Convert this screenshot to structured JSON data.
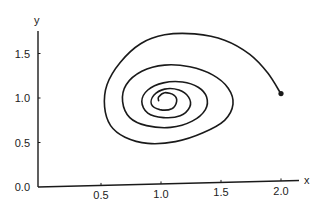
{
  "chart_data": {
    "type": "line",
    "title": "",
    "xlabel": "x",
    "ylabel": "y",
    "xlim": [
      0,
      2.1
    ],
    "ylim": [
      0,
      1.75
    ],
    "grid": false,
    "legend": null,
    "x_ticks": [
      {
        "value": 0.5,
        "label": "0.5"
      },
      {
        "value": 1.0,
        "label": "1.0"
      },
      {
        "value": 1.5,
        "label": "1.5"
      },
      {
        "value": 2.0,
        "label": "2.0"
      }
    ],
    "y_ticks": [
      {
        "value": 0.0,
        "label": "0.0"
      },
      {
        "value": 0.5,
        "label": "0.5"
      },
      {
        "value": 1.0,
        "label": "1.0"
      },
      {
        "value": 1.5,
        "label": "1.5"
      }
    ],
    "start_point": {
      "x": 2.0,
      "y": 1.05
    },
    "series": [
      {
        "name": "spiral trajectory",
        "color": "#1a1a1a",
        "points": [
          [
            2.0,
            1.045
          ],
          [
            1.89,
            1.28
          ],
          [
            1.74,
            1.49
          ],
          [
            1.53,
            1.65
          ],
          [
            1.28,
            1.72
          ],
          [
            1.03,
            1.71
          ],
          [
            0.83,
            1.61
          ],
          [
            0.66,
            1.4
          ],
          [
            0.55,
            1.15
          ],
          [
            0.53,
            0.9
          ],
          [
            0.58,
            0.69
          ],
          [
            0.7,
            0.56
          ],
          [
            0.89,
            0.49
          ],
          [
            1.12,
            0.51
          ],
          [
            1.35,
            0.61
          ],
          [
            1.53,
            0.75
          ],
          [
            1.6,
            0.93
          ],
          [
            1.56,
            1.11
          ],
          [
            1.43,
            1.26
          ],
          [
            1.24,
            1.35
          ],
          [
            1.03,
            1.37
          ],
          [
            0.84,
            1.3
          ],
          [
            0.71,
            1.15
          ],
          [
            0.68,
            0.96
          ],
          [
            0.74,
            0.78
          ],
          [
            0.88,
            0.69
          ],
          [
            1.08,
            0.67
          ],
          [
            1.26,
            0.74
          ],
          [
            1.37,
            0.87
          ],
          [
            1.38,
            1.01
          ],
          [
            1.31,
            1.12
          ],
          [
            1.18,
            1.18
          ],
          [
            1.02,
            1.17
          ],
          [
            0.89,
            1.09
          ],
          [
            0.84,
            0.96
          ],
          [
            0.89,
            0.83
          ],
          [
            1.02,
            0.78
          ],
          [
            1.16,
            0.8
          ],
          [
            1.24,
            0.9
          ],
          [
            1.23,
            1.01
          ],
          [
            1.15,
            1.09
          ],
          [
            1.03,
            1.1
          ],
          [
            0.94,
            1.03
          ],
          [
            0.92,
            0.93
          ],
          [
            0.99,
            0.87
          ],
          [
            1.09,
            0.88
          ],
          [
            1.13,
            0.96
          ],
          [
            1.11,
            1.03
          ],
          [
            1.03,
            1.06
          ],
          [
            0.98,
            1.01
          ],
          [
            0.98,
            0.97
          ]
        ]
      }
    ]
  },
  "axes": {
    "x_label": "x",
    "y_label": "y"
  }
}
